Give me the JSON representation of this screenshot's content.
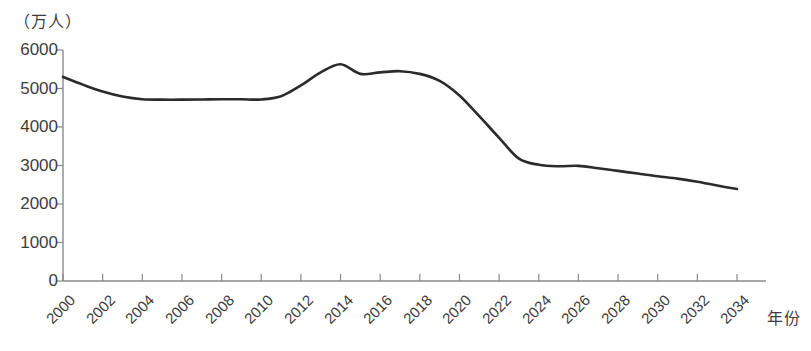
{
  "chart_data": {
    "type": "line",
    "title": "",
    "ylabel": "（万人）",
    "xlabel": "年份",
    "ylim": [
      0,
      6000
    ],
    "ytick_labels": [
      "0",
      "1000",
      "2000",
      "3000",
      "4000",
      "5000",
      "6000"
    ],
    "yticks": [
      0,
      1000,
      2000,
      3000,
      4000,
      5000,
      6000
    ],
    "xlim": [
      2000,
      2034
    ],
    "xtick_labels": [
      "2000",
      "2002",
      "2004",
      "2006",
      "2008",
      "2010",
      "2012",
      "2014",
      "2016",
      "2018",
      "2020",
      "2022",
      "2024",
      "2026",
      "2028",
      "2030",
      "2032",
      "2034"
    ],
    "xticks": [
      2000,
      2002,
      2004,
      2006,
      2008,
      2010,
      2012,
      2014,
      2016,
      2018,
      2020,
      2022,
      2024,
      2026,
      2028,
      2030,
      2032,
      2034
    ],
    "grid": false,
    "legend": false,
    "line_color": "#2b2b2b",
    "axis_color": "#8a8a8a",
    "series": [
      {
        "name": "新生儿数量",
        "x": [
          2000,
          2001,
          2002,
          2003,
          2004,
          2005,
          2006,
          2007,
          2008,
          2009,
          2010,
          2011,
          2012,
          2013,
          2014,
          2015,
          2016,
          2017,
          2018,
          2019,
          2020,
          2021,
          2022,
          2023,
          2024,
          2025,
          2026,
          2027,
          2028,
          2029,
          2030,
          2031,
          2032,
          2033,
          2034
        ],
        "values": [
          5300,
          5100,
          4920,
          4790,
          4720,
          4710,
          4710,
          4715,
          4720,
          4720,
          4715,
          4800,
          5080,
          5420,
          5630,
          5380,
          5420,
          5450,
          5380,
          5200,
          4820,
          4280,
          3720,
          3180,
          3020,
          2980,
          2990,
          2930,
          2860,
          2790,
          2720,
          2660,
          2580,
          2480,
          2390
        ]
      }
    ]
  }
}
